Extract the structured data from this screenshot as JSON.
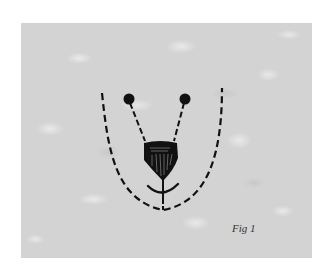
{
  "figure": {
    "caption": "Fig 1",
    "colors": {
      "background": "#ffffff",
      "panel": "#d3d3d3",
      "ink": "#111111"
    },
    "elements": {
      "outline": "dashed-u-curve",
      "eyes": [
        "left-eye-dot",
        "right-eye-dot"
      ],
      "eye_lines": [
        "left-dashed-line",
        "right-dashed-line"
      ],
      "nose": "shaded-shield-nose",
      "mouth": "curved-mouth-line",
      "center_line": "dashed-center-line"
    }
  }
}
